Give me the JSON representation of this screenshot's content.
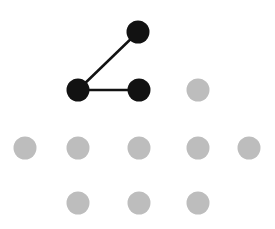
{
  "diagram": {
    "type": "node-graph",
    "width": 275,
    "height": 229,
    "colors": {
      "active_node": "#121212",
      "inactive_node": "#bdbdbd",
      "edge": "#121212",
      "background": "#ffffff"
    },
    "node_radius": 11.5,
    "nodes": [
      {
        "id": "n1",
        "x": 138,
        "y": 32,
        "state": "active"
      },
      {
        "id": "n2",
        "x": 78,
        "y": 90,
        "state": "active"
      },
      {
        "id": "n3",
        "x": 139,
        "y": 90,
        "state": "active"
      },
      {
        "id": "n4",
        "x": 198,
        "y": 90,
        "state": "inactive"
      },
      {
        "id": "n5",
        "x": 25,
        "y": 148,
        "state": "inactive"
      },
      {
        "id": "n6",
        "x": 78,
        "y": 148,
        "state": "inactive"
      },
      {
        "id": "n7",
        "x": 139,
        "y": 148,
        "state": "inactive"
      },
      {
        "id": "n8",
        "x": 198,
        "y": 148,
        "state": "inactive"
      },
      {
        "id": "n9",
        "x": 249,
        "y": 148,
        "state": "inactive"
      },
      {
        "id": "n10",
        "x": 78,
        "y": 203,
        "state": "inactive"
      },
      {
        "id": "n11",
        "x": 139,
        "y": 203,
        "state": "inactive"
      },
      {
        "id": "n12",
        "x": 198,
        "y": 203,
        "state": "inactive"
      }
    ],
    "edges": [
      {
        "from": "n1",
        "to": "n2"
      },
      {
        "from": "n2",
        "to": "n3"
      }
    ]
  }
}
